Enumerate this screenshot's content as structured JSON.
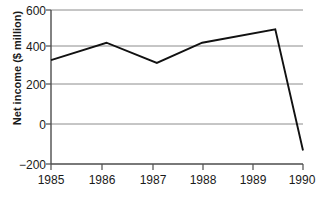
{
  "chart_data": {
    "type": "line",
    "title": "",
    "subtitle": "",
    "xlabel": "",
    "ylabel": "Net income ($ million)",
    "x": [
      1985,
      1986,
      1987,
      1988,
      1989,
      1990
    ],
    "categories": [
      "1985",
      "1986",
      "1987",
      "1988",
      "1989",
      "1990"
    ],
    "series": [
      {
        "name": "Net income",
        "points": [
          {
            "x": 1985.0,
            "y": 340
          },
          {
            "x": 1986.1,
            "y": 430
          },
          {
            "x": 1987.1,
            "y": 325
          },
          {
            "x": 1988.0,
            "y": 430
          },
          {
            "x": 1989.45,
            "y": 500
          },
          {
            "x": 1990.0,
            "y": -130
          }
        ],
        "values": [
          340,
          430,
          325,
          430,
          500,
          -130
        ],
        "color": "#111111"
      }
    ],
    "xlim": [
      1985,
      1990
    ],
    "ylim": [
      -200,
      600
    ],
    "yticks": [
      -200,
      0,
      200,
      400,
      600
    ],
    "ytick_labels": [
      "−200",
      "0",
      "200",
      "400",
      "600"
    ],
    "xticks": [
      1985,
      1986,
      1987,
      1988,
      1989,
      1990
    ],
    "xtick_labels": [
      "1985",
      "1986",
      "1987",
      "1988",
      "1989",
      "1990"
    ],
    "grid": true,
    "grid_axis": "y",
    "grid_color": "#8c8c8c",
    "legend": false,
    "legend_position": "none",
    "annotations": [],
    "background_color": "#ffffff",
    "axis_color": "#4d4d4d",
    "text_color": "#1a1a1a"
  }
}
